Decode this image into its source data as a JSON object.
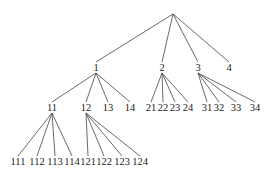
{
  "diagram": {
    "type": "tree",
    "root": {
      "id": "root",
      "label": "",
      "x": 173,
      "y": 14
    },
    "nodes": [
      {
        "id": "1",
        "label": "1",
        "x": 96,
        "y": 68,
        "parent": "root",
        "ay": 62
      },
      {
        "id": "2",
        "label": "2",
        "x": 162,
        "y": 68,
        "parent": "root",
        "ay": 62
      },
      {
        "id": "3",
        "label": "3",
        "x": 198,
        "y": 68,
        "parent": "root",
        "ay": 62
      },
      {
        "id": "4",
        "label": "4",
        "x": 229,
        "y": 68,
        "parent": "root",
        "ay": 62
      },
      {
        "id": "11",
        "label": "11",
        "x": 52,
        "y": 108,
        "parent": "1",
        "ay": 102
      },
      {
        "id": "12",
        "label": "12",
        "x": 86,
        "y": 108,
        "parent": "1",
        "ay": 102
      },
      {
        "id": "13",
        "label": "13",
        "x": 108,
        "y": 108,
        "parent": "1",
        "ay": 102
      },
      {
        "id": "14",
        "label": "14",
        "x": 130,
        "y": 108,
        "parent": "1",
        "ay": 102
      },
      {
        "id": "21",
        "label": "21",
        "x": 151,
        "y": 108,
        "parent": "2",
        "ay": 102
      },
      {
        "id": "22",
        "label": "22",
        "x": 163,
        "y": 108,
        "parent": "2",
        "ay": 102
      },
      {
        "id": "23",
        "label": "23",
        "x": 175,
        "y": 108,
        "parent": "2",
        "ay": 102
      },
      {
        "id": "24",
        "label": "24",
        "x": 188,
        "y": 108,
        "parent": "2",
        "ay": 102
      },
      {
        "id": "31",
        "label": "31",
        "x": 207,
        "y": 108,
        "parent": "3",
        "ay": 102
      },
      {
        "id": "32",
        "label": "32",
        "x": 219,
        "y": 108,
        "parent": "3",
        "ay": 102
      },
      {
        "id": "33",
        "label": "33",
        "x": 236,
        "y": 108,
        "parent": "3",
        "ay": 102
      },
      {
        "id": "34",
        "label": "34",
        "x": 255,
        "y": 108,
        "parent": "3",
        "ay": 102
      },
      {
        "id": "111",
        "label": "111",
        "x": 18,
        "y": 162,
        "parent": "11",
        "ay": 156
      },
      {
        "id": "112",
        "label": "112",
        "x": 37,
        "y": 162,
        "parent": "11",
        "ay": 156
      },
      {
        "id": "113",
        "label": "113",
        "x": 55,
        "y": 162,
        "parent": "11",
        "ay": 156
      },
      {
        "id": "114",
        "label": "114",
        "x": 72,
        "y": 162,
        "parent": "11",
        "ay": 156
      },
      {
        "id": "121",
        "label": "121",
        "x": 88,
        "y": 162,
        "parent": "12",
        "ay": 156
      },
      {
        "id": "122",
        "label": "122",
        "x": 104,
        "y": 162,
        "parent": "12",
        "ay": 156
      },
      {
        "id": "123",
        "label": "123",
        "x": 122,
        "y": 162,
        "parent": "12",
        "ay": 156
      },
      {
        "id": "124",
        "label": "124",
        "x": 140,
        "y": 162,
        "parent": "12",
        "ay": 156
      }
    ]
  }
}
